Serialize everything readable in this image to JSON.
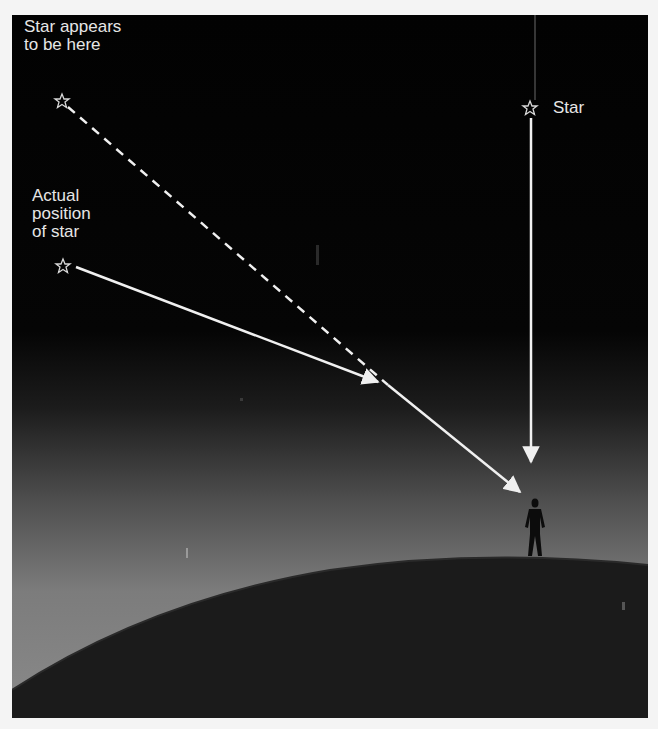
{
  "diagram": {
    "labels": {
      "apparent_line1": "Star appears",
      "apparent_line2": "to be here",
      "actual_line1": "Actual",
      "actual_line2": "position",
      "actual_line3": "of star",
      "star": "Star"
    },
    "colors": {
      "sky_top": "#020202",
      "sky_horizon": "#8a8a8a",
      "earth": "#1a1a1a",
      "ray": "#f0f0f0",
      "star_glyph": "#d8d8d8",
      "frame_background": "#f4f4f4"
    },
    "elements": [
      {
        "name": "apparent-star-position",
        "icon": "star-icon",
        "x": 62,
        "y": 101
      },
      {
        "name": "actual-star-position",
        "icon": "star-icon",
        "x": 63,
        "y": 266
      },
      {
        "name": "overhead-star",
        "icon": "star-icon",
        "x": 530,
        "y": 108
      },
      {
        "name": "observer",
        "icon": "person-silhouette",
        "x": 535,
        "y": 530
      },
      {
        "name": "earth-surface",
        "shape": "arc"
      }
    ],
    "rays": [
      {
        "name": "apparent-ray",
        "style": "dashed",
        "from": "apparent-star-position",
        "to": "refraction-point"
      },
      {
        "name": "incoming-ray",
        "style": "solid-arrow",
        "from": "actual-star-position",
        "to": "refraction-point"
      },
      {
        "name": "refracted-ray",
        "style": "solid-arrow",
        "from": "refraction-point",
        "to": "observer"
      },
      {
        "name": "vertical-ray",
        "style": "solid-arrow",
        "from": "overhead-star",
        "to": "observer"
      }
    ]
  }
}
